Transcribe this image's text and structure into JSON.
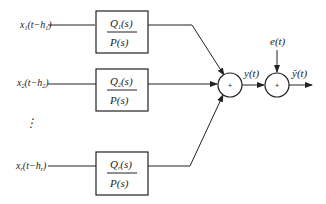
{
  "diagram": {
    "inputs": [
      {
        "label_pre": "x",
        "label_sub": "1",
        "label_post": "(t−h",
        "label_sub2": "1",
        "label_end": ")"
      },
      {
        "label_pre": "x",
        "label_sub": "2",
        "label_post": "(t−h",
        "label_sub2": "2",
        "label_end": ")"
      },
      {
        "label_pre": "x",
        "label_sub": "r",
        "label_post": "(t−h",
        "label_sub2": "r",
        "label_end": ")"
      }
    ],
    "blocks": [
      {
        "num_pre": "Q",
        "num_sub": "1",
        "num_post": "(s)",
        "den": "P(s)"
      },
      {
        "num_pre": "Q",
        "num_sub": "2",
        "num_post": "(s)",
        "den": "P(s)"
      },
      {
        "num_pre": "Q",
        "num_sub": "r",
        "num_post": "(s)",
        "den": "P(s)"
      }
    ],
    "ellipsis": "⋮",
    "sum1": {
      "symbol": "+"
    },
    "sum2": {
      "symbol": "+"
    },
    "signal_y": "y(t)",
    "noise": "e(t)",
    "output": "ŷ(t)",
    "colors": {
      "line": "#222222",
      "background": "#ffffff"
    }
  }
}
